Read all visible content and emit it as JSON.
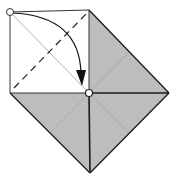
{
  "diagram": {
    "type": "origami-fold-step",
    "colors": {
      "background": "#ffffff",
      "paper_colored_side": "#bdbdbd",
      "paper_white_side": "#ffffff",
      "edge": "#222222",
      "crease": "#a6a6a6",
      "diagonal_crease_white": "#b0b0b0",
      "arrow": "#111111"
    },
    "points": {
      "top_left_corner": [
        10,
        12
      ],
      "top_right_corner": [
        89,
        10
      ],
      "center": [
        89,
        93
      ],
      "left_corner": [
        10,
        93
      ],
      "right_point": [
        169,
        93
      ],
      "bottom_point": [
        90,
        173
      ]
    },
    "annotations": {
      "start_marker": "circle at top-left corner",
      "end_marker": "circle at center point",
      "fold_line": "dashed valley fold from left-bottom to top-right of white square",
      "arrow": "curved arrow from top-left corner to center"
    }
  }
}
